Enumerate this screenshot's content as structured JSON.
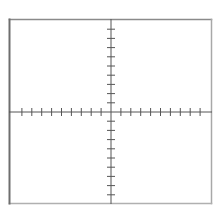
{
  "diagram": {
    "type": "cartesian-axes",
    "title": "",
    "canvas": {
      "width": 223,
      "height": 214,
      "background": "#ffffff"
    },
    "frame": {
      "x1": 9.5,
      "y1": 19.5,
      "x2": 211.5,
      "y2": 203.5,
      "color_top": "#8a8a8a",
      "color_left": "#6e6e6e",
      "color_right": "#a8a8a8",
      "color_bottom": "#b0b0b0",
      "left_width": 2,
      "other_width": 1.5
    },
    "origin": {
      "x": 111,
      "y": 112
    },
    "x_axis": {
      "color": "#555555",
      "width": 1,
      "label": "",
      "ticks_per_side": 9,
      "tick_spacing": 9.9,
      "tick_half_length": 3.5,
      "tick_labels": []
    },
    "y_axis": {
      "color": "#555555",
      "width": 1,
      "label": "",
      "ticks_per_side": 9,
      "tick_spacing": 9.2,
      "tick_half_length": 3.5,
      "tick_labels": []
    },
    "data_points": []
  }
}
